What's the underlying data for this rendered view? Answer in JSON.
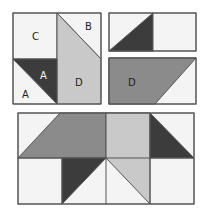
{
  "colors": {
    "background": "#ffffff",
    "white_patch": "#f4f4f4",
    "light_gray": "#c9c9c9",
    "medium_gray": "#8b8b8b",
    "dark": "#3c3c3c",
    "outline": "#555555"
  },
  "blocks": {
    "top_left": {
      "labels": {
        "c": "C",
        "b": "B",
        "a_dark": "A",
        "a_light": "A",
        "d": "D"
      }
    },
    "top_right_upper": {
      "labels": {}
    },
    "top_right_lower": {
      "labels": {
        "d": "D"
      }
    },
    "bottom_assembled": {
      "labels": {}
    }
  }
}
